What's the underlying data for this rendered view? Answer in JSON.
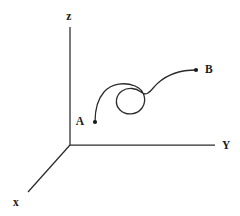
{
  "figure": {
    "background_color": "#ffffff",
    "line_color": "#2b2b2b",
    "label_color": "#1a1a1a",
    "width": 240,
    "height": 216
  },
  "axes": {
    "origin": {
      "x": 70,
      "y": 145
    },
    "items": [
      {
        "id": "z",
        "label": "z",
        "from": {
          "x": 70,
          "y": 145
        },
        "to": {
          "x": 70,
          "y": 27
        },
        "label_pos": {
          "x": 69,
          "y": 20
        }
      },
      {
        "id": "y",
        "label": "Y",
        "from": {
          "x": 70,
          "y": 145
        },
        "to": {
          "x": 215,
          "y": 145
        },
        "label_pos": {
          "x": 222,
          "y": 149
        }
      },
      {
        "id": "x",
        "label": "x",
        "from": {
          "x": 70,
          "y": 145
        },
        "to": {
          "x": 28,
          "y": 192
        },
        "label_pos": {
          "x": 13,
          "y": 206
        }
      }
    ]
  },
  "trajectory": {
    "name": "spiral-path",
    "start_label": "A",
    "end_label": "B",
    "start_point": {
      "x": 95,
      "y": 122
    },
    "end_point": {
      "x": 196,
      "y": 70
    },
    "start_label_pos": {
      "x": 80,
      "y": 125
    },
    "end_label_pos": {
      "x": 205,
      "y": 73
    },
    "spiral_center": {
      "x": 131,
      "y": 99
    },
    "spiral_radius": 14,
    "path_d": "M 95 122 C 95 112, 96 101, 104 92 C 112 83, 125 82, 135 86 C 145 90, 147 101, 142 108 C 137 115, 126 116, 120 110 C 114 104, 116 95, 122 91 C 128 87, 136 88, 141 92 C 148 98, 152 88, 158 83 C 168 74, 182 70, 196 70"
  }
}
